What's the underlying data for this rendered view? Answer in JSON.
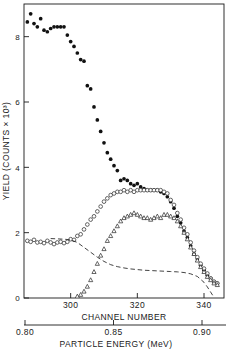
{
  "chart_data": {
    "type": "scatter",
    "title": "",
    "xlabel": "CHANNEL NUMBER",
    "ylabel": "YIELD (COUNTS × 10³)",
    "secondary_xlabel": "PARTICLE ENERGY (MeV)",
    "xlim": [
      286,
      346
    ],
    "ylim": [
      0,
      9
    ],
    "xticks": [
      300,
      320,
      340
    ],
    "xticklabels": [
      "300",
      "320",
      "340"
    ],
    "yticks": [
      0,
      2,
      4,
      6,
      8
    ],
    "yticklabels": [
      "0",
      "2",
      "4",
      "6",
      "8"
    ],
    "secondary_xticks": [
      0.8,
      0.85,
      0.9
    ],
    "secondary_xticklabels": [
      "0.80",
      "0.85",
      "0.90"
    ],
    "grid": false,
    "legend": "none",
    "series": [
      {
        "name": "filled-circles",
        "marker": "filled-circle",
        "color": "#111111",
        "x": [
          287,
          288,
          289,
          290,
          291,
          292,
          293,
          294,
          295,
          296,
          297,
          298,
          299,
          300,
          301,
          302,
          303,
          304,
          305,
          306,
          307,
          308,
          309,
          310,
          311,
          312,
          313,
          314,
          315,
          316,
          317,
          318,
          319,
          320,
          321,
          322,
          323,
          324,
          325,
          326,
          327,
          328,
          329,
          330,
          331,
          332,
          333,
          334,
          335,
          336,
          337,
          338,
          339,
          340,
          341,
          342,
          343,
          344
        ],
        "y": [
          8.45,
          8.7,
          8.4,
          8.3,
          8.55,
          8.2,
          8.15,
          8.25,
          8.3,
          8.3,
          8.3,
          8.3,
          8.05,
          7.85,
          7.7,
          7.5,
          7.3,
          7.25,
          6.5,
          6.4,
          5.85,
          5.45,
          5.1,
          4.75,
          4.45,
          4.25,
          4.05,
          3.9,
          3.6,
          3.65,
          3.6,
          3.5,
          3.45,
          3.5,
          3.4,
          3.35,
          3.3,
          3.3,
          3.3,
          3.3,
          3.25,
          3.2,
          3.1,
          2.95,
          2.75,
          2.5,
          2.3,
          2.05,
          1.85,
          1.6,
          1.35,
          1.2,
          1.0,
          0.85,
          0.7,
          0.6,
          0.5,
          0.45
        ]
      },
      {
        "name": "open-circles",
        "marker": "open-circle",
        "color": "#333333",
        "x": [
          287,
          288,
          289,
          290,
          291,
          292,
          293,
          294,
          295,
          296,
          297,
          298,
          299,
          300,
          301,
          302,
          303,
          304,
          305,
          306,
          307,
          308,
          309,
          310,
          311,
          312,
          313,
          314,
          315,
          316,
          317,
          318,
          319,
          320,
          321,
          322,
          323,
          324,
          325,
          326,
          327,
          328,
          329,
          330,
          331,
          332,
          333,
          334,
          335,
          336,
          337,
          338,
          339,
          340,
          341,
          342,
          343,
          344
        ],
        "y": [
          1.75,
          1.72,
          1.78,
          1.7,
          1.72,
          1.68,
          1.75,
          1.7,
          1.65,
          1.7,
          1.72,
          1.68,
          1.72,
          1.8,
          1.78,
          1.9,
          1.95,
          2.1,
          2.25,
          2.4,
          2.5,
          2.65,
          2.8,
          2.95,
          3.05,
          3.15,
          3.2,
          3.25,
          3.25,
          3.3,
          3.25,
          3.3,
          3.25,
          3.3,
          3.3,
          3.3,
          3.3,
          3.3,
          3.3,
          3.3,
          3.3,
          3.25,
          3.2,
          3.0,
          2.85,
          2.6,
          2.4,
          2.15,
          1.95,
          1.7,
          1.45,
          1.25,
          1.05,
          0.9,
          0.75,
          0.6,
          0.5,
          0.45
        ]
      },
      {
        "name": "open-triangles",
        "marker": "open-triangle",
        "color": "#333333",
        "x": [
          302,
          303,
          304,
          305,
          306,
          307,
          308,
          309,
          310,
          311,
          312,
          313,
          314,
          315,
          316,
          317,
          318,
          319,
          320,
          321,
          322,
          323,
          324,
          325,
          326,
          327,
          328,
          329,
          330,
          331,
          332,
          333,
          334,
          335,
          336,
          337,
          338,
          339,
          340,
          341,
          342,
          343,
          344
        ],
        "y": [
          0.05,
          0.1,
          0.2,
          0.35,
          0.55,
          0.8,
          1.05,
          1.3,
          1.5,
          1.75,
          1.9,
          2.05,
          2.2,
          2.35,
          2.45,
          2.5,
          2.55,
          2.6,
          2.55,
          2.5,
          2.45,
          2.45,
          2.4,
          2.45,
          2.5,
          2.45,
          2.55,
          2.55,
          2.5,
          2.45,
          2.35,
          2.2,
          2.0,
          1.8,
          1.55,
          1.35,
          1.15,
          0.95,
          0.8,
          0.65,
          0.55,
          0.45,
          0.4
        ]
      },
      {
        "name": "dashed-background-curve",
        "marker": "dashed-line",
        "color": "#222222",
        "x": [
          294,
          298,
          300,
          302,
          304,
          306,
          308,
          310,
          312,
          314,
          316,
          318,
          320,
          322,
          324,
          326,
          328,
          330,
          332,
          334,
          336,
          338,
          340,
          341,
          342,
          343
        ],
        "y": [
          1.82,
          1.8,
          1.78,
          1.7,
          1.55,
          1.4,
          1.25,
          1.12,
          1.02,
          0.96,
          0.92,
          0.89,
          0.87,
          0.85,
          0.84,
          0.83,
          0.82,
          0.81,
          0.8,
          0.78,
          0.74,
          0.66,
          0.48,
          0.34,
          0.18,
          0.02
        ]
      }
    ]
  }
}
